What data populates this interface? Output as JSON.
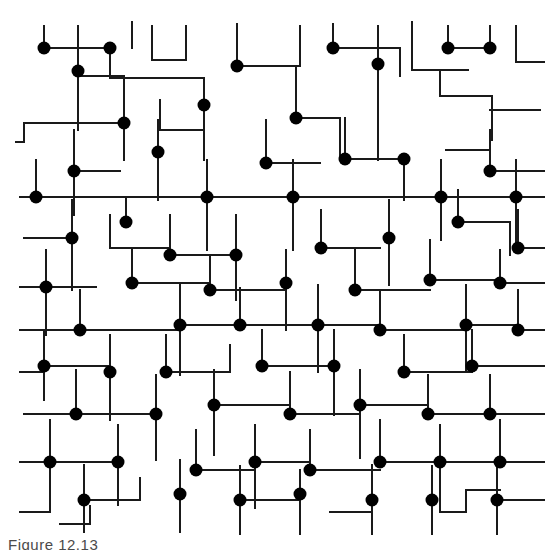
{
  "figure": {
    "caption": "Figure 12.13",
    "background_color": "#ffffff",
    "line_color": "#1a1a1a",
    "node_color": "#000000",
    "line_width": 2,
    "node_radius": 6.5,
    "canvas": {
      "width": 546,
      "height": 550
    },
    "grid": {
      "origin_x": 24,
      "origin_y": 22,
      "spacing_x": 34.5,
      "spacing_y": 34.5,
      "columns": 15,
      "rows": 15,
      "visible": false
    }
  },
  "chart_data": {
    "type": "scatter",
    "title": "Figure 12.13",
    "xlabel": "",
    "ylabel": "",
    "grid": false,
    "legend": null,
    "xlim": [
      0,
      546
    ],
    "ylim": [
      0,
      530
    ],
    "node_count": 104,
    "nodes": [
      [
        44,
        48
      ],
      [
        110,
        48
      ],
      [
        237,
        66
      ],
      [
        333,
        48
      ],
      [
        448,
        48
      ],
      [
        490,
        48
      ],
      [
        78,
        71
      ],
      [
        204,
        105
      ],
      [
        124,
        123
      ],
      [
        296,
        118
      ],
      [
        378,
        64
      ],
      [
        158,
        152
      ],
      [
        74,
        171
      ],
      [
        266,
        163
      ],
      [
        345,
        159
      ],
      [
        404,
        159
      ],
      [
        490,
        171
      ],
      [
        36,
        197
      ],
      [
        126,
        222
      ],
      [
        207,
        197
      ],
      [
        293,
        197
      ],
      [
        441,
        197
      ],
      [
        516,
        197
      ],
      [
        72,
        238
      ],
      [
        170,
        255
      ],
      [
        236,
        255
      ],
      [
        321,
        248
      ],
      [
        389,
        238
      ],
      [
        458,
        222
      ],
      [
        518,
        248
      ],
      [
        46,
        287
      ],
      [
        132,
        283
      ],
      [
        210,
        290
      ],
      [
        286,
        283
      ],
      [
        355,
        290
      ],
      [
        430,
        280
      ],
      [
        500,
        283
      ],
      [
        80,
        330
      ],
      [
        180,
        325
      ],
      [
        240,
        325
      ],
      [
        318,
        325
      ],
      [
        380,
        330
      ],
      [
        466,
        325
      ],
      [
        518,
        330
      ],
      [
        44,
        366
      ],
      [
        110,
        372
      ],
      [
        166,
        372
      ],
      [
        262,
        366
      ],
      [
        334,
        366
      ],
      [
        404,
        372
      ],
      [
        472,
        366
      ],
      [
        76,
        414
      ],
      [
        156,
        414
      ],
      [
        214,
        405
      ],
      [
        290,
        414
      ],
      [
        360,
        405
      ],
      [
        428,
        414
      ],
      [
        490,
        414
      ],
      [
        50,
        462
      ],
      [
        118,
        462
      ],
      [
        196,
        470
      ],
      [
        255,
        462
      ],
      [
        310,
        470
      ],
      [
        380,
        462
      ],
      [
        440,
        462
      ],
      [
        500,
        462
      ],
      [
        84,
        500
      ],
      [
        180,
        494
      ],
      [
        240,
        500
      ],
      [
        300,
        494
      ],
      [
        372,
        500
      ],
      [
        432,
        500
      ],
      [
        497,
        500
      ]
    ]
  }
}
